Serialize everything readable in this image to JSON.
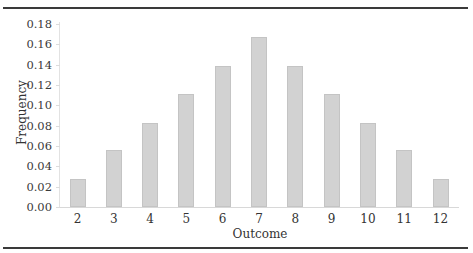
{
  "chart_data": {
    "type": "bar",
    "title": "",
    "xlabel": "Outcome",
    "ylabel": "Frequency",
    "categories": [
      "2",
      "3",
      "4",
      "5",
      "6",
      "7",
      "8",
      "9",
      "10",
      "11",
      "12"
    ],
    "values": [
      0.028,
      0.056,
      0.083,
      0.111,
      0.139,
      0.167,
      0.139,
      0.111,
      0.083,
      0.056,
      0.028
    ],
    "ylim": [
      0,
      0.18
    ],
    "yticks": [
      "0.00",
      "0.02",
      "0.04",
      "0.06",
      "0.08",
      "0.10",
      "0.12",
      "0.14",
      "0.16",
      "0.18"
    ],
    "grid": false,
    "legend": null,
    "bar_color": "#d2d2d2"
  }
}
